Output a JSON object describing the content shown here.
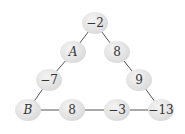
{
  "diagram": {
    "type": "number-triangle",
    "nodes": [
      {
        "id": "top",
        "label": "−2",
        "x": 95,
        "y": 23
      },
      {
        "id": "left1",
        "label": "A",
        "x": 73,
        "y": 52,
        "variable": true
      },
      {
        "id": "right1",
        "label": "8",
        "x": 117,
        "y": 52
      },
      {
        "id": "left2",
        "label": "−7",
        "x": 49,
        "y": 80
      },
      {
        "id": "right2",
        "label": "9",
        "x": 139,
        "y": 80
      },
      {
        "id": "bottom-left",
        "label": "B",
        "x": 28,
        "y": 110,
        "variable": true
      },
      {
        "id": "bottom1",
        "label": "8",
        "x": 72,
        "y": 110
      },
      {
        "id": "bottom2",
        "label": "−3",
        "x": 117,
        "y": 110
      },
      {
        "id": "bottom-right",
        "label": "−13",
        "x": 161,
        "y": 110
      }
    ],
    "edges": [
      [
        "top",
        "left1"
      ],
      [
        "left1",
        "left2"
      ],
      [
        "left2",
        "bottom-left"
      ],
      [
        "top",
        "right1"
      ],
      [
        "right1",
        "right2"
      ],
      [
        "right2",
        "bottom-right"
      ],
      [
        "bottom-left",
        "bottom1"
      ],
      [
        "bottom1",
        "bottom2"
      ],
      [
        "bottom2",
        "bottom-right"
      ]
    ]
  }
}
